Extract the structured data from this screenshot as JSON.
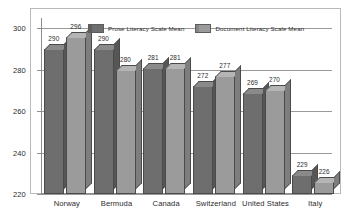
{
  "chart_data": {
    "type": "bar",
    "title": "",
    "subtitle": "",
    "xlabel": "",
    "ylabel": "",
    "categories": [
      "Norway",
      "Bermuda",
      "Canada",
      "Switzerland",
      "United States",
      "Italy"
    ],
    "series": [
      {
        "name": "Prose Literacy Scale Mean",
        "color": "#6e6e6e",
        "values": [
          290,
          290,
          281,
          272,
          269,
          229
        ]
      },
      {
        "name": "Document Literacy Scale Mean",
        "color": "#9b9b9b",
        "values": [
          296,
          280,
          281,
          277,
          270,
          226
        ]
      }
    ],
    "ylim": [
      220,
      305
    ],
    "yticks": [
      220,
      240,
      260,
      280,
      300
    ],
    "ytick_labels": [
      "220",
      "240",
      "260",
      "280",
      "300"
    ],
    "grid": true,
    "grid_orientation": "horizontal",
    "legend_position": "top-center",
    "data_labels": true,
    "style": "3d-grouped-bar-grayscale"
  }
}
